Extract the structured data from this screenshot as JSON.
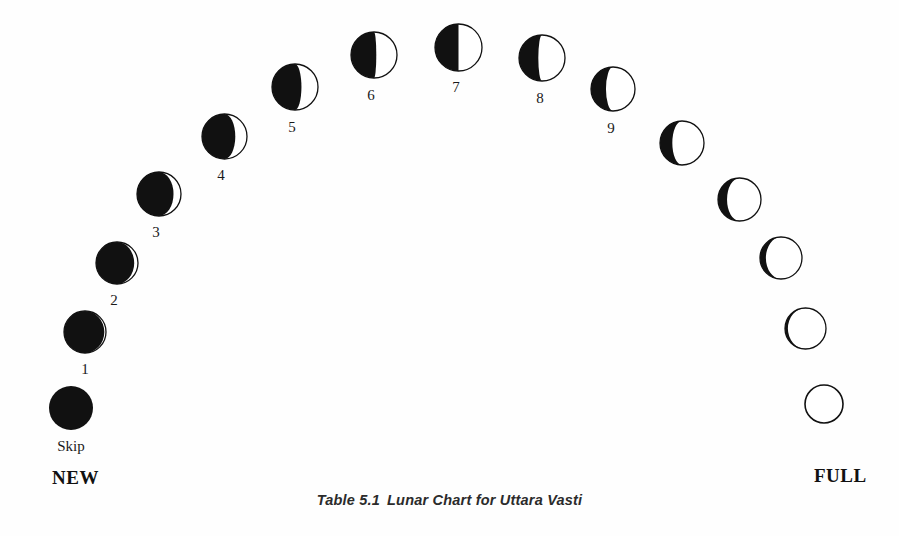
{
  "figure": {
    "caption_number": "Table 5.1",
    "caption_text": "Lunar Chart for Uttara Vasti",
    "background_color": "#ffffff",
    "ink_color": "#111111"
  },
  "endpoints": {
    "new_label": "NEW",
    "full_label": "FULL"
  },
  "skip": {
    "label": "Skip"
  },
  "chart_data": {
    "type": "scatter",
    "subtitle": "",
    "xlabel": "",
    "ylabel": "",
    "grid": false,
    "legend": "none",
    "xlim": [
      0,
      899
    ],
    "ylim": [
      0,
      536
    ],
    "phase_labels": [
      "Skip",
      "1",
      "2",
      "3",
      "4",
      "5",
      "6",
      "7",
      "8",
      "9",
      "",
      "",
      "",
      "",
      "",
      "",
      "",
      "",
      "",
      ""
    ],
    "illumination_percent": [
      0,
      4,
      9,
      17,
      26,
      36,
      45,
      50,
      58,
      66,
      72,
      79,
      85,
      90,
      94,
      97,
      99,
      100,
      100,
      100
    ],
    "points": [
      {
        "id": "skip",
        "label": "Skip",
        "cx": 71,
        "cy": 408,
        "r": 22.0,
        "illum": 0,
        "lit_side": "right",
        "outline": false,
        "label_dx": 0,
        "label_dy": 31
      },
      {
        "id": "p1",
        "label": "1",
        "cx": 85,
        "cy": 332,
        "r": 21.0,
        "illum": 4,
        "lit_side": "right",
        "outline": true,
        "label_dx": 0,
        "label_dy": 30
      },
      {
        "id": "p2",
        "label": "2",
        "cx": 117,
        "cy": 263,
        "r": 21.0,
        "illum": 9,
        "lit_side": "right",
        "outline": true,
        "label_dx": -3,
        "label_dy": 30
      },
      {
        "id": "p3",
        "label": "3",
        "cx": 159,
        "cy": 194,
        "r": 22.0,
        "illum": 17,
        "lit_side": "right",
        "outline": true,
        "label_dx": -3,
        "label_dy": 31
      },
      {
        "id": "p4",
        "label": "4",
        "cx": 224,
        "cy": 136,
        "r": 22.5,
        "illum": 26,
        "lit_side": "right",
        "outline": true,
        "label_dx": -3,
        "label_dy": 32
      },
      {
        "id": "p5",
        "label": "5",
        "cx": 295,
        "cy": 87,
        "r": 23.0,
        "illum": 36,
        "lit_side": "right",
        "outline": true,
        "label_dx": -3,
        "label_dy": 33
      },
      {
        "id": "p6",
        "label": "6",
        "cx": 374,
        "cy": 55,
        "r": 23.0,
        "illum": 45,
        "lit_side": "right",
        "outline": true,
        "label_dx": -3,
        "label_dy": 33
      },
      {
        "id": "p7",
        "label": "7",
        "cx": 458,
        "cy": 47,
        "r": 23.5,
        "illum": 50,
        "lit_side": "right",
        "outline": true,
        "label_dx": -2,
        "label_dy": 33
      },
      {
        "id": "p8",
        "label": "8",
        "cx": 542,
        "cy": 58,
        "r": 23.0,
        "illum": 58,
        "lit_side": "right",
        "outline": true,
        "label_dx": -2,
        "label_dy": 33
      },
      {
        "id": "p9",
        "label": "9",
        "cx": 613,
        "cy": 89,
        "r": 22.0,
        "illum": 66,
        "lit_side": "right",
        "outline": true,
        "label_dx": -2,
        "label_dy": 32
      },
      {
        "id": "p10",
        "label": "",
        "cx": 682,
        "cy": 143,
        "r": 22.0,
        "illum": 72,
        "lit_side": "right",
        "outline": true,
        "label_dx": 0,
        "label_dy": 0
      },
      {
        "id": "p11",
        "label": "",
        "cx": 739,
        "cy": 199,
        "r": 21.5,
        "illum": 79,
        "lit_side": "right",
        "outline": true,
        "label_dx": 0,
        "label_dy": 0
      },
      {
        "id": "p12",
        "label": "",
        "cx": 781,
        "cy": 258,
        "r": 21.0,
        "illum": 86,
        "lit_side": "right",
        "outline": true,
        "label_dx": 0,
        "label_dy": 0
      },
      {
        "id": "p13",
        "label": "",
        "cx": 805,
        "cy": 328,
        "r": 20.5,
        "illum": 93,
        "lit_side": "right",
        "outline": true,
        "label_dx": 0,
        "label_dy": 0
      },
      {
        "id": "p14",
        "label": "",
        "cx": 824,
        "cy": 404,
        "r": 19.0,
        "illum": 100,
        "lit_side": "right",
        "outline": true,
        "label_dx": 0,
        "label_dy": 0
      }
    ],
    "annotations": [
      {
        "text": "NEW",
        "x": 52,
        "y": 470
      },
      {
        "text": "FULL",
        "x": 815,
        "y": 468
      },
      {
        "text": "Skip",
        "x": 55,
        "y": 432
      }
    ]
  }
}
